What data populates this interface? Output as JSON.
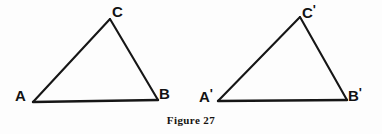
{
  "figure": {
    "caption": "Figure 27",
    "background_color": "#fdfdfd",
    "stroke_color": "#161616",
    "label_color": "#121212"
  },
  "triangles": [
    {
      "name": "triangle-abc",
      "vertices": [
        {
          "id": "A",
          "label": "A",
          "prime": "",
          "x": 33,
          "y": 102
        },
        {
          "id": "B",
          "label": "B",
          "prime": "",
          "x": 158,
          "y": 100
        },
        {
          "id": "C",
          "label": "C",
          "prime": "",
          "x": 110,
          "y": 19
        }
      ]
    },
    {
      "name": "triangle-abc-prime",
      "vertices": [
        {
          "id": "A2",
          "label": "A",
          "prime": "'",
          "x": 218,
          "y": 101
        },
        {
          "id": "B2",
          "label": "B",
          "prime": "'",
          "x": 347,
          "y": 100
        },
        {
          "id": "C2",
          "label": "C",
          "prime": "'",
          "x": 300,
          "y": 17
        }
      ]
    }
  ],
  "labels": {
    "a": "A",
    "b": "B",
    "c": "C",
    "a_prime_base": "A",
    "b_prime_base": "B",
    "c_prime_base": "C",
    "prime_mark": "'"
  }
}
